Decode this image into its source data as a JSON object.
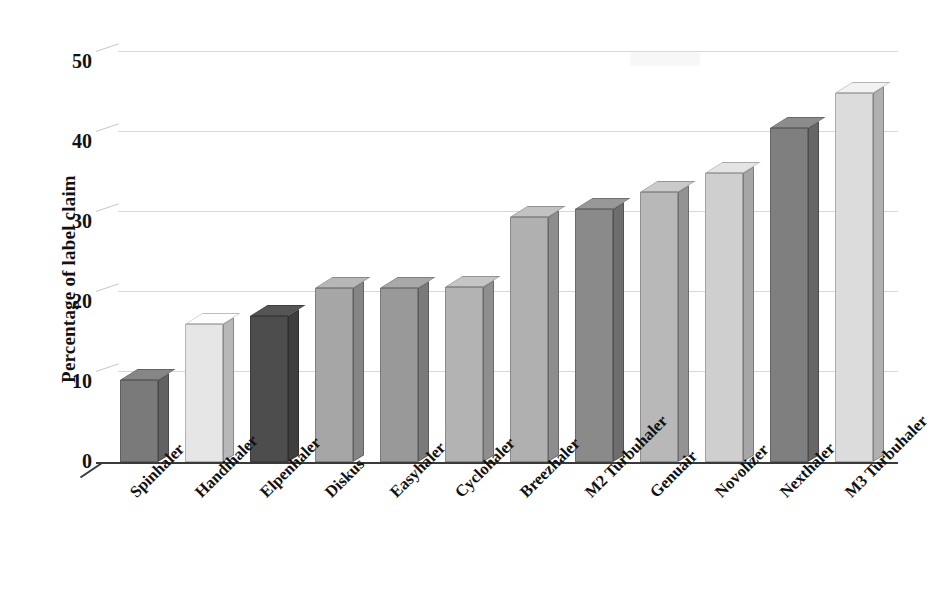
{
  "chart_data": {
    "type": "bar",
    "title": "",
    "subtitle": "",
    "xlabel": "",
    "ylabel": "Percentage of label claim",
    "ylim": [
      0,
      50
    ],
    "ytick_values": [
      0,
      10,
      20,
      30,
      40,
      50
    ],
    "ytick_labels": [
      "0",
      "10",
      "20",
      "30",
      "40",
      "50"
    ],
    "grid": true,
    "legend": false,
    "style_3d": true,
    "categories": [
      "Spinhaler",
      "Handihaler",
      "Elpenhaler",
      "Diskus",
      "Easyhaler",
      "Cyclohaler",
      "Breezhaler",
      "M2 Turbuhaler",
      "Genuair",
      "Novolizer",
      "Nexthaler",
      "M3 Turbuhaler"
    ],
    "values": [
      10.3,
      17.3,
      18.2,
      21.7,
      21.7,
      21.9,
      30.6,
      31.6,
      33.8,
      36.1,
      41.7,
      46.1
    ],
    "bar_colors": [
      "#7a7a7a",
      "#e6e6e6",
      "#4d4d4d",
      "#a6a6a6",
      "#999999",
      "#b3b3b3",
      "#b0b0b0",
      "#8a8a8a",
      "#b8b8b8",
      "#cfcfcf",
      "#7f7f7f",
      "#dcdcdc"
    ]
  },
  "axis": {
    "y_title": "Percentage of label claim"
  },
  "colors": {
    "gridline": "#d7d7d7",
    "baseline": "#3a3a3a",
    "text": "#111111",
    "background": "#ffffff"
  }
}
